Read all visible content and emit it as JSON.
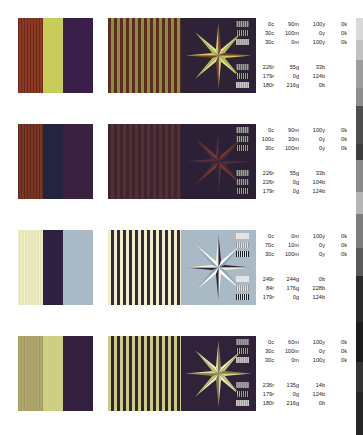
{
  "page": {
    "background": "#ffffff",
    "text_color": "#1a1a1a"
  },
  "legend_columns": [
    "c",
    "m",
    "y",
    "k"
  ],
  "rgb_columns": [
    "r",
    "g",
    "b"
  ],
  "rows": [
    {
      "id": "row-1",
      "top": 18,
      "panels": {
        "bars": {
          "name": "vertical-bands-panel",
          "bands": [
            "#6a2a1c",
            "#c8cc5a",
            "#3a1f4a"
          ],
          "striped_band_index": 0,
          "stripe_color": "#8d3a24"
        },
        "stripes": {
          "name": "fine-stripes-panel",
          "colors": [
            "#5e2b20",
            "#8a8f3e"
          ],
          "stripe_width": 3
        },
        "star": {
          "name": "starburst-panel",
          "background": "#2e2236",
          "points": 8,
          "ray_colors": [
            "#c9cd62",
            "#e0e3a0",
            "#7d3a28",
            "#b8bc55"
          ]
        }
      },
      "cmyk": [
        {
          "swatch": "#5f5f5f",
          "values": [
            "0c",
            "90m",
            "100y",
            "0k"
          ]
        },
        {
          "swatch": "#1e1e1e",
          "values": [
            "30c",
            "100m",
            "0y",
            "0k"
          ]
        },
        {
          "swatch": "#b6b6b6",
          "values": [
            "30c",
            "0m",
            "100y",
            "0k"
          ]
        }
      ],
      "rgb": [
        {
          "swatch": "#5f5f5f",
          "values": [
            "226r",
            "55g",
            "33b"
          ]
        },
        {
          "swatch": "#1e1e1e",
          "values": [
            "179r",
            "0g",
            "124b"
          ]
        },
        {
          "swatch": "#c9c9c9",
          "values": [
            "180r",
            "216g",
            "0b"
          ]
        }
      ]
    },
    {
      "id": "row-2",
      "top": 124,
      "panels": {
        "bars": {
          "name": "vertical-bands-panel",
          "bands": [
            "#5a2a1e",
            "#25243f",
            "#3b2140"
          ],
          "striped_band_index": 0,
          "stripe_color": "#7a3523"
        },
        "stripes": {
          "name": "fine-stripes-panel",
          "colors": [
            "#3e2330",
            "#55302c"
          ],
          "stripe_width": 3
        },
        "star": {
          "name": "starburst-panel",
          "background": "#2c2036",
          "points": 8,
          "ray_colors": [
            "#5d2f38",
            "#7a3a2c",
            "#2a2545",
            "#4a2b3c"
          ]
        }
      },
      "cmyk": [
        {
          "swatch": "#5f5f5f",
          "values": [
            "0c",
            "90m",
            "100y",
            "0k"
          ]
        },
        {
          "swatch": "#3a3a3a",
          "values": [
            "100c",
            "30m",
            "0y",
            "0k"
          ]
        },
        {
          "swatch": "#1e1e1e",
          "values": [
            "30c",
            "100m",
            "0y",
            "0k"
          ]
        }
      ],
      "rgb": [
        {
          "swatch": "#5f5f5f",
          "values": [
            "226r",
            "55g",
            "33b"
          ]
        },
        {
          "swatch": "#3a3a3a",
          "values": [
            "226r",
            "0g",
            "104b"
          ]
        },
        {
          "swatch": "#1e1e1e",
          "values": [
            "179r",
            "0g",
            "124b"
          ]
        }
      ]
    },
    {
      "id": "row-3",
      "top": 230,
      "panels": {
        "bars": {
          "name": "vertical-bands-panel",
          "bands": [
            "#f0efcf",
            "#2d2140",
            "#a9b9c6"
          ],
          "striped_band_index": 0,
          "stripe_color": "#e6e4b4"
        },
        "stripes": {
          "name": "fine-stripes-panel",
          "colors": [
            "#efeec8",
            "#35263f"
          ],
          "stripe_width": 3
        },
        "star": {
          "name": "starburst-panel",
          "background": "#a9b9c6",
          "points": 8,
          "ray_colors": [
            "#f2f0cd",
            "#ffffff",
            "#2e2140",
            "#8ba3b6"
          ]
        }
      },
      "cmyk": [
        {
          "swatch": "#e8e8e8",
          "values": [
            "0c",
            "0m",
            "100y",
            "0k"
          ]
        },
        {
          "swatch": "#9a9a9a",
          "values": [
            "70c",
            "10m",
            "0y",
            "0k"
          ]
        },
        {
          "swatch": "#1e1e1e",
          "values": [
            "30c",
            "100m",
            "0y",
            "0k"
          ]
        }
      ],
      "rgb": [
        {
          "swatch": "#e8e8e8",
          "values": [
            "249r",
            "244g",
            "0b"
          ]
        },
        {
          "swatch": "#9a9a9a",
          "values": [
            "84r",
            "176g",
            "228b"
          ]
        },
        {
          "swatch": "#1e1e1e",
          "values": [
            "179r",
            "0g",
            "124b"
          ]
        }
      ]
    },
    {
      "id": "row-4",
      "top": 336,
      "panels": {
        "bars": {
          "name": "vertical-bands-panel",
          "bands": [
            "#a49a63",
            "#cdd083",
            "#33203f"
          ],
          "striped_band_index": 0,
          "stripe_color": "#b0a76d"
        },
        "stripes": {
          "name": "fine-stripes-panel",
          "colors": [
            "#cbcd85",
            "#34213e"
          ],
          "stripe_width": 3
        },
        "star": {
          "name": "starburst-panel",
          "background": "#2f2239",
          "points": 8,
          "ray_colors": [
            "#d6d893",
            "#eef0c4",
            "#8a7a4a",
            "#c2c47a"
          ]
        }
      },
      "cmyk": [
        {
          "swatch": "#7a7a7a",
          "values": [
            "0c",
            "60m",
            "100y",
            "0k"
          ]
        },
        {
          "swatch": "#1e1e1e",
          "values": [
            "30c",
            "100m",
            "0y",
            "0k"
          ]
        },
        {
          "swatch": "#c4c4c4",
          "values": [
            "30c",
            "0m",
            "100y",
            "0k"
          ]
        }
      ],
      "rgb": [
        {
          "swatch": "#8a8a8a",
          "values": [
            "236r",
            "135g",
            "14b"
          ]
        },
        {
          "swatch": "#1e1e1e",
          "values": [
            "179r",
            "0g",
            "124b"
          ]
        },
        {
          "swatch": "#c9c9c9",
          "values": [
            "180r",
            "216g",
            "0b"
          ]
        }
      ]
    }
  ],
  "edge_strip": {
    "name": "right-edge-color-strip",
    "segments": [
      {
        "color": "#ffffff",
        "height": 18
      },
      {
        "color": "#d9d9d9",
        "height": 22
      },
      {
        "color": "#c2c2c2",
        "height": 20
      },
      {
        "color": "#9d9d9d",
        "height": 28
      },
      {
        "color": "#8e8e8e",
        "height": 18
      },
      {
        "color": "#4e4e4e",
        "height": 38
      },
      {
        "color": "#3d3d3d",
        "height": 16
      },
      {
        "color": "#8a8a8a",
        "height": 32
      },
      {
        "color": "#b5b5b5",
        "height": 22
      },
      {
        "color": "#7d7d7d",
        "height": 34
      },
      {
        "color": "#5a5a5a",
        "height": 28
      },
      {
        "color": "#2a2a2a",
        "height": 46
      },
      {
        "color": "#1c1c1c",
        "height": 40
      },
      {
        "color": "#343434",
        "height": 30
      },
      {
        "color": "#262626",
        "height": 43
      }
    ]
  }
}
